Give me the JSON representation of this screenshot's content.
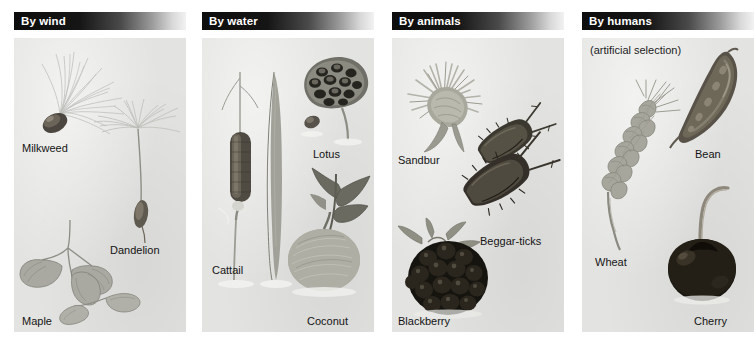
{
  "figure": {
    "background_color": "#ffffff",
    "panel_background_color": "#e3e3e1",
    "header_text_color": "#ffffff",
    "caption_text_color": "#141414"
  },
  "panels": [
    {
      "id": "by-wind",
      "header": "By wind",
      "subtitle": "",
      "captions": [
        {
          "label": "Milkweed",
          "x": 8,
          "y": 104
        },
        {
          "label": "Dandelion",
          "x": 96,
          "y": 206
        },
        {
          "label": "Maple",
          "x": 8,
          "y": 277
        }
      ]
    },
    {
      "id": "by-water",
      "header": "By water",
      "subtitle": "",
      "captions": [
        {
          "label": "Lotus",
          "x": 111,
          "y": 110
        },
        {
          "label": "Cattail",
          "x": 10,
          "y": 226
        },
        {
          "label": "Coconut",
          "x": 105,
          "y": 277
        }
      ]
    },
    {
      "id": "by-animals",
      "header": "By animals",
      "subtitle": "",
      "captions": [
        {
          "label": "Sandbur",
          "x": 6,
          "y": 116
        },
        {
          "label": "Beggar-ticks",
          "x": 88,
          "y": 197
        },
        {
          "label": "Blackberry",
          "x": 6,
          "y": 277
        }
      ]
    },
    {
      "id": "by-humans",
      "header": "By humans",
      "subtitle": "(artificial selection)",
      "captions": [
        {
          "label": "Bean",
          "x": 113,
          "y": 110
        },
        {
          "label": "Wheat",
          "x": 13,
          "y": 218
        },
        {
          "label": "Cherry",
          "x": 112,
          "y": 277
        }
      ]
    }
  ]
}
